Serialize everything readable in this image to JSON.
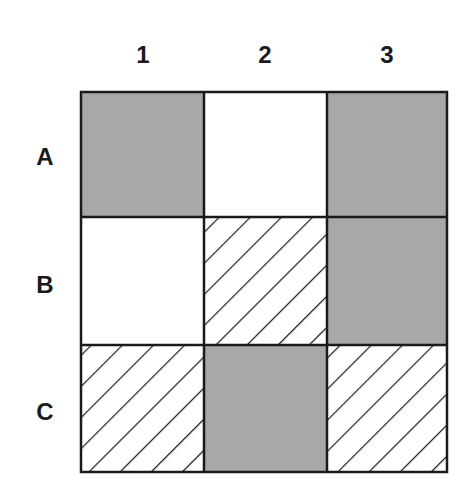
{
  "diagram": {
    "type": "grid",
    "rows": 3,
    "cols": 3,
    "col_labels": [
      "1",
      "2",
      "3"
    ],
    "row_labels": [
      "A",
      "B",
      "C"
    ],
    "cells": [
      [
        "gray",
        "white",
        "gray"
      ],
      [
        "white",
        "hatched",
        "gray"
      ],
      [
        "hatched",
        "gray",
        "hatched"
      ]
    ],
    "colors": {
      "gray": "#a8a8a8",
      "white": "#ffffff",
      "line": "#1a1a1a",
      "hatch": "#1a1a1a"
    }
  }
}
